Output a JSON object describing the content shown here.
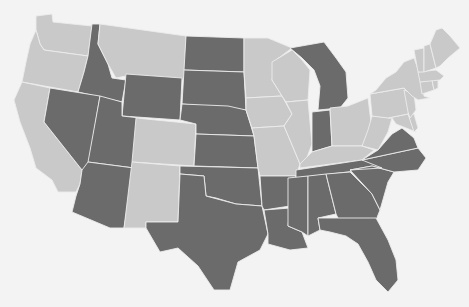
{
  "map": {
    "type": "choropleth",
    "region": "Contiguous United States",
    "title": "",
    "legend": [],
    "colors": {
      "background": "#f3f3f3",
      "category_a": "#6b6b6b",
      "category_b": "#c9c9c9",
      "border": "#ececec"
    },
    "category_a_states": [
      "ID",
      "NV",
      "UT",
      "AZ",
      "WY",
      "ND",
      "SD",
      "NE",
      "KS",
      "OK",
      "TX",
      "MI",
      "IN",
      "AR",
      "LA",
      "MS",
      "AL",
      "GA",
      "FL",
      "SC",
      "NC",
      "TN",
      "VA"
    ],
    "category_b_states": [
      "WA",
      "OR",
      "CA",
      "MT",
      "CO",
      "NM",
      "MN",
      "IA",
      "MO",
      "WI",
      "IL",
      "OH",
      "KY",
      "WV",
      "PA",
      "NY",
      "VT",
      "NH",
      "ME",
      "MA",
      "CT",
      "RI",
      "NJ",
      "DE",
      "MD"
    ]
  },
  "states": [
    {
      "id": "WA",
      "cat": "b",
      "d": "M36,16 L52,14 L53,22 L92,26 L88,56 L44,50 L40,44 L36,30 Z"
    },
    {
      "id": "OR",
      "cat": "b",
      "d": "M36,30 L40,44 L44,50 L88,56 L84,72 L78,92 L22,82 L26,62 L30,44 Z"
    },
    {
      "id": "CA",
      "cat": "b",
      "d": "M22,82 L50,88 L44,122 L82,170 L80,184 L76,192 L58,192 L52,180 L36,168 L30,148 L20,122 L14,100 Z"
    },
    {
      "id": "ID",
      "cat": "a",
      "d": "M92,24 L100,24 L98,44 L108,64 L112,78 L126,80 L122,102 L78,92 L84,72 L88,56 Z"
    },
    {
      "id": "MT",
      "cat": "b",
      "d": "M100,24 L186,36 L184,80 L126,76 L116,78 L108,64 L98,44 Z"
    },
    {
      "id": "WY",
      "cat": "a",
      "d": "M126,74 L182,78 L180,120 L122,116 Z"
    },
    {
      "id": "NV",
      "cat": "a",
      "d": "M50,88 L100,96 L88,168 L82,170 L44,122 Z"
    },
    {
      "id": "UT",
      "cat": "a",
      "d": "M100,96 L122,102 L122,116 L140,118 L134,168 L88,162 Z"
    },
    {
      "id": "AZ",
      "cat": "a",
      "d": "M88,162 L134,168 L124,228 L110,228 L72,212 L76,196 L80,184 L82,170 Z"
    },
    {
      "id": "CO",
      "cat": "b",
      "d": "M136,118 L196,124 L194,166 L132,162 Z"
    },
    {
      "id": "NM",
      "cat": "b",
      "d": "M132,162 L180,166 L178,222 L146,222 L146,228 L124,228 Z"
    },
    {
      "id": "ND",
      "cat": "a",
      "d": "M186,36 L244,38 L244,72 L184,70 Z"
    },
    {
      "id": "SD",
      "cat": "a",
      "d": "M184,70 L244,72 L246,110 L228,108 L182,104 Z"
    },
    {
      "id": "NE",
      "cat": "a",
      "d": "M182,104 L228,106 L246,110 L254,136 L196,134 L196,124 L180,120 Z"
    },
    {
      "id": "KS",
      "cat": "a",
      "d": "M196,134 L254,136 L258,168 L194,166 Z"
    },
    {
      "id": "OK",
      "cat": "a",
      "d": "M180,166 L258,168 L262,206 L236,204 L216,198 L206,196 L204,176 L180,174 Z"
    },
    {
      "id": "TX",
      "cat": "a",
      "d": "M180,174 L204,176 L206,196 L236,204 L262,206 L268,234 L260,250 L238,262 L230,290 L214,290 L198,266 L178,248 L160,252 L146,228 L146,222 L178,222 Z"
    },
    {
      "id": "MN",
      "cat": "b",
      "d": "M244,38 L268,38 L292,48 L276,60 L272,80 L282,96 L246,98 L244,72 Z"
    },
    {
      "id": "IA",
      "cat": "b",
      "d": "M246,98 L282,96 L292,114 L284,126 L252,128 L246,110 Z"
    },
    {
      "id": "MO",
      "cat": "b",
      "d": "M252,128 L284,126 L290,140 L300,164 L296,176 L260,176 L258,168 L254,136 Z"
    },
    {
      "id": "AR",
      "cat": "a",
      "d": "M260,176 L296,176 L290,206 L264,210 L262,206 Z"
    },
    {
      "id": "LA",
      "cat": "a",
      "d": "M264,210 L290,208 L288,226 L302,232 L308,248 L290,250 L268,244 L268,234 Z"
    },
    {
      "id": "WI",
      "cat": "b",
      "d": "M272,62 L292,50 L302,60 L310,70 L308,100 L286,102 L282,96 L272,80 Z"
    },
    {
      "id": "IL",
      "cat": "b",
      "d": "M286,102 L308,100 L312,144 L306,160 L300,164 L290,140 L284,126 L292,114 Z"
    },
    {
      "id": "MI",
      "cat": "a",
      "d": "M290,48 L324,42 L336,58 L346,72 L348,98 L340,108 L318,110 L320,86 L314,70 L302,58 Z"
    },
    {
      "id": "IN",
      "cat": "a",
      "d": "M312,112 L330,110 L332,146 L312,152 Z"
    },
    {
      "id": "OH",
      "cat": "b",
      "d": "M330,108 L348,106 L368,98 L372,130 L362,146 L344,146 L332,146 Z"
    },
    {
      "id": "KY",
      "cat": "b",
      "d": "M300,164 L312,152 L332,146 L362,146 L374,150 L362,160 L300,168 Z"
    },
    {
      "id": "TN",
      "cat": "a",
      "d": "M296,170 L362,160 L390,156 L382,168 L296,178 Z"
    },
    {
      "id": "MS",
      "cat": "a",
      "d": "M288,178 L308,176 L308,236 L302,232 L288,226 Z"
    },
    {
      "id": "AL",
      "cat": "a",
      "d": "M308,176 L326,174 L336,214 L318,218 L320,230 L308,236 Z"
    },
    {
      "id": "GA",
      "cat": "a",
      "d": "M326,174 L350,172 L372,194 L380,210 L376,220 L340,222 L336,214 Z"
    },
    {
      "id": "FL",
      "cat": "a",
      "d": "M318,218 L376,218 L388,240 L396,260 L398,280 L388,292 L376,280 L368,262 L358,244 L346,236 L330,232 L320,230 Z"
    },
    {
      "id": "SC",
      "cat": "a",
      "d": "M350,170 L372,166 L394,172 L388,182 L380,210 L372,194 Z"
    },
    {
      "id": "NC",
      "cat": "a",
      "d": "M362,160 L418,148 L426,158 L418,170 L394,172 L372,166 L350,170 L382,168 Z"
    },
    {
      "id": "VA",
      "cat": "a",
      "d": "M362,160 L378,150 L392,134 L402,128 L414,138 L418,148 Z"
    },
    {
      "id": "WV",
      "cat": "b",
      "d": "M368,130 L372,116 L392,118 L388,132 L378,150 L362,146 Z"
    },
    {
      "id": "MD",
      "cat": "b",
      "d": "M388,118 L408,114 L416,132 L406,128 L396,124 L392,118 Z"
    },
    {
      "id": "DE",
      "cat": "b",
      "d": "M408,114 L414,114 L418,128 L414,132 Z"
    },
    {
      "id": "PA",
      "cat": "b",
      "d": "M370,94 L404,88 L412,98 L408,114 L388,118 L372,116 Z"
    },
    {
      "id": "NJ",
      "cat": "b",
      "d": "M404,90 L414,94 L416,110 L410,118 L408,112 Z"
    },
    {
      "id": "NY",
      "cat": "b",
      "d": "M376,90 L386,78 L396,72 L404,62 L414,58 L422,80 L424,96 L430,98 L418,100 L412,96 L404,88 L370,94 Z"
    },
    {
      "id": "CT",
      "cat": "b",
      "d": "M420,82 L432,80 L434,90 L422,94 Z"
    },
    {
      "id": "RI",
      "cat": "b",
      "d": "M432,80 L438,80 L438,88 L434,90 Z"
    },
    {
      "id": "MA",
      "cat": "b",
      "d": "M418,72 L436,70 L444,76 L440,80 L420,82 Z"
    },
    {
      "id": "VT",
      "cat": "b",
      "d": "M414,50 L424,48 L424,72 L418,72 Z"
    },
    {
      "id": "NH",
      "cat": "b",
      "d": "M424,46 L430,44 L436,68 L424,72 Z"
    },
    {
      "id": "ME",
      "cat": "b",
      "d": "M430,44 L436,30 L442,28 L450,36 L460,48 L448,58 L440,66 L436,68 Z"
    }
  ]
}
